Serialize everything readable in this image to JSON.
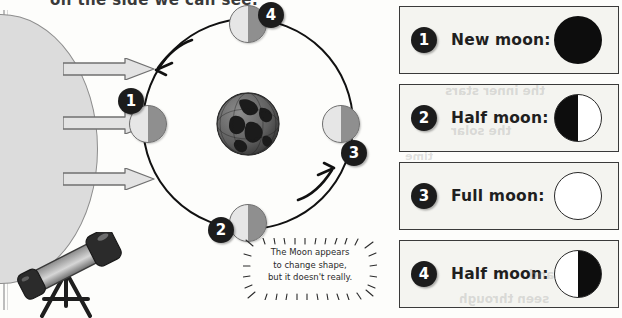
{
  "headline": "on the side we can see.",
  "diagram": {
    "sun_label": "sun",
    "light_rays": [
      {
        "name": "sunlight-ray-top"
      },
      {
        "name": "sunlight-ray-middle"
      },
      {
        "name": "sunlight-ray-bottom"
      }
    ],
    "earth_label": "Earth",
    "orbit_direction": "counterclockwise",
    "moon_positions": [
      {
        "number": "1",
        "position": "left"
      },
      {
        "number": "2",
        "position": "bottom"
      },
      {
        "number": "3",
        "position": "right"
      },
      {
        "number": "4",
        "position": "top"
      }
    ],
    "callout_lines": [
      "The Moon appears",
      "to change shape,",
      "but it doesn't really."
    ],
    "telescope_label": "telescope"
  },
  "legend": {
    "rows": [
      {
        "number": "1",
        "label": "New moon:",
        "phase": "new"
      },
      {
        "number": "2",
        "label": "Half moon:",
        "phase": "half-left"
      },
      {
        "number": "3",
        "label": "Full moon:",
        "phase": "full"
      },
      {
        "number": "4",
        "label": "Half moon:",
        "phase": "half-right"
      }
    ]
  },
  "colors": {
    "ink": "#1c1c1c",
    "sun_fill": "#dcdcdc",
    "moon_lit": "#e6e6e6",
    "moon_dark": "#8f8f8f",
    "panel_bg": "#f4f4f0"
  },
  "ghost_text": [
    {
      "text": "the inner stars",
      "x": 46,
      "y": 84,
      "size": 12
    },
    {
      "text": "the solar",
      "x": 52,
      "y": 124,
      "size": 12
    },
    {
      "text": "time",
      "x": 6,
      "y": 150,
      "size": 11
    },
    {
      "text": "and",
      "x": 130,
      "y": 268,
      "size": 12
    },
    {
      "text": "seen through",
      "x": 60,
      "y": 292,
      "size": 12
    }
  ]
}
